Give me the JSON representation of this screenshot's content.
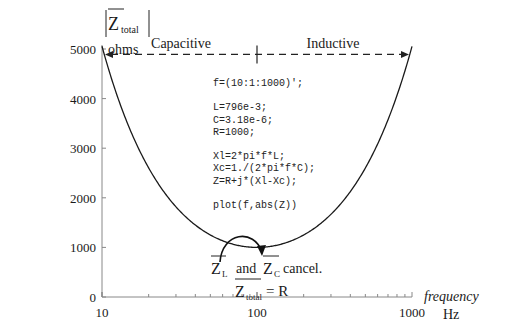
{
  "chart_data": {
    "type": "line",
    "title": "",
    "xlabel": "frequency",
    "xunit": "Hz",
    "ylabel_main": "Z",
    "ylabel_sub": "total",
    "yunit": "ohms",
    "xscale": "log",
    "xlim": [
      10,
      1000
    ],
    "ylim": [
      0,
      5000
    ],
    "x_ticks": [
      "10",
      "100",
      "1000"
    ],
    "y_ticks": [
      "0",
      "1000",
      "2000",
      "3000",
      "4000",
      "5000"
    ],
    "y_tick_values": [
      0,
      1000,
      2000,
      3000,
      4000,
      5000
    ],
    "x_tick_values": [
      10,
      100,
      1000
    ],
    "grid": false,
    "series": [
      {
        "name": "|Z_total|",
        "model": {
          "L": 0.796,
          "C": 3.18e-06,
          "R": 1000
        },
        "x_range": [
          10,
          1000
        ]
      }
    ],
    "annotations": {
      "region_left": "Capacitive",
      "region_right": "Inductive",
      "region_line_value": 4850,
      "resonance_freq": 100,
      "cancel_zl": "Z",
      "cancel_zl_sub": "L",
      "cancel_and": "and",
      "cancel_zc": "Z",
      "cancel_zc_sub": "C",
      "cancel_text": "cancel.",
      "total_z": "Z",
      "total_sub": "total",
      "total_eq": "= R"
    },
    "code_lines": [
      "f=(10:1:1000)';",
      "",
      "L=796e-3;",
      "C=3.18e-6;",
      "R=1000;",
      "",
      "Xl=2*pi*f*L;",
      "Xc=1./(2*pi*f*C);",
      "Z=R+j*(Xl-Xc);",
      "",
      "plot(f,abs(Z))"
    ]
  }
}
